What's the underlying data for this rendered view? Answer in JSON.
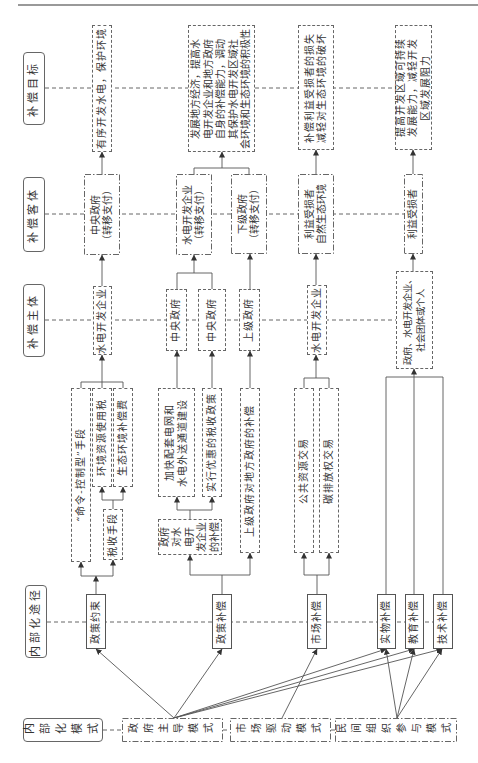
{
  "figure": {
    "row_labels": {
      "goal": "补偿目标",
      "object": "补偿客体",
      "subject": "补偿主体",
      "path": "内部化途径",
      "mode": "内部化模式"
    },
    "goals": [
      {
        "lines": [
          "有序开发水电，保护环境"
        ]
      },
      {
        "lines": [
          "发展地方经济，提高水",
          "电开发企业和地方政府",
          "自身的补偿能力，调动",
          "其保护水电开发区域社",
          "会环境和生态环境的积极性"
        ]
      },
      {
        "lines": [
          "补偿利益受损者的损失",
          "减轻对生态环境的破坏"
        ]
      },
      {
        "lines": [
          "提高开发区域可持续",
          "发展能力，减轻开发",
          "区域发展阻力"
        ]
      }
    ],
    "objects": [
      {
        "lines": [
          "中央政府",
          "（转移支付）"
        ]
      },
      {
        "lines": [
          "水电开发企业",
          "（转移支付）"
        ]
      },
      {
        "lines": [
          "下级政府",
          "（转移支付）"
        ]
      },
      {
        "lines": [
          "利益受损者",
          "自然生态环境"
        ]
      },
      {
        "lines": [
          "利益受损者"
        ]
      }
    ],
    "subjects": [
      {
        "lines": [
          "水电开发企业"
        ]
      },
      {
        "lines": [
          "中央政府"
        ]
      },
      {
        "lines": [
          "中央政府"
        ]
      },
      {
        "lines": [
          "上级政府"
        ]
      },
      {
        "lines": [
          "水电开发企业"
        ]
      },
      {
        "lines": [
          "政府、水电开发企业、",
          "社会团体或个人"
        ]
      }
    ],
    "measures": [
      {
        "lines": [
          "“命令-控制型”手段"
        ]
      },
      {
        "lines": [
          "环境资源使用税"
        ]
      },
      {
        "lines": [
          "生态环境补偿费"
        ]
      },
      {
        "lines": [
          "税收手段"
        ]
      },
      {
        "lines": [
          "加快配套电网和",
          "水电外送通道建设"
        ]
      },
      {
        "lines": [
          "实行优惠的税收政策"
        ]
      },
      {
        "lines": [
          "政府",
          "对水",
          "电开",
          "发企业",
          "的补偿"
        ]
      },
      {
        "lines": [
          "上级政府对地方政府的补偿"
        ]
      },
      {
        "lines": [
          "公共资源交易"
        ]
      },
      {
        "lines": [
          "碳排放权交易"
        ]
      }
    ],
    "paths": [
      "政策约束",
      "政策补偿",
      "市场补偿",
      "实物补偿",
      "教育补偿",
      "技术补偿"
    ],
    "modes": [
      "政府主导模式",
      "市场驱动模式",
      "民间组织参与模式"
    ]
  },
  "colors": {
    "line": "#555555",
    "text": "#333333",
    "background": "#ffffff"
  }
}
